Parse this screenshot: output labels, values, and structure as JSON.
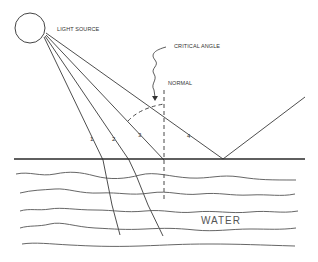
{
  "labels": {
    "light_source": "LIGHT SOURCE",
    "critical_angle": "CRITICAL ANGLE",
    "normal": "NORMAL",
    "water": "WATER",
    "ray_1": "1",
    "ray_2": "2",
    "ray_3": "3",
    "ray_4": "4"
  },
  "colors": {
    "line": "#3a3a3a",
    "background": "#ffffff"
  }
}
